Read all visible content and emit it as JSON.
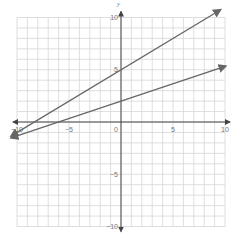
{
  "chart_data": {
    "type": "line",
    "title": "",
    "xlabel": "x",
    "ylabel": "y",
    "xlim": [
      -10,
      10
    ],
    "ylim": [
      -10,
      10
    ],
    "grid": true,
    "grid_step": 1,
    "x_ticks": [
      -10,
      -5,
      0,
      5,
      10
    ],
    "y_ticks": [
      10,
      5,
      -5,
      -10
    ],
    "tick_labels": {
      "x": [
        "-10",
        "-5",
        "0",
        "5",
        "10"
      ],
      "y": [
        "10",
        "5",
        "-5",
        "-10"
      ]
    },
    "series": [
      {
        "name": "line-1",
        "equation": "y = 0.6x + 5",
        "slope": 0.6,
        "intercept": 5,
        "x": [
          -10.5,
          9.5
        ],
        "y": [
          -1.3,
          10.7
        ],
        "arrows": "both",
        "color": "#666666"
      },
      {
        "name": "line-2",
        "equation": "y = (1/3)x + 2",
        "slope": 0.3333,
        "intercept": 2,
        "x": [
          -10.5,
          10
        ],
        "y": [
          -1.5,
          5.33
        ],
        "arrows": "both",
        "color": "#666666"
      }
    ],
    "legend": null
  },
  "colors": {
    "grid": "#d6d6d6",
    "axis": "#444444",
    "line": "#666666"
  }
}
